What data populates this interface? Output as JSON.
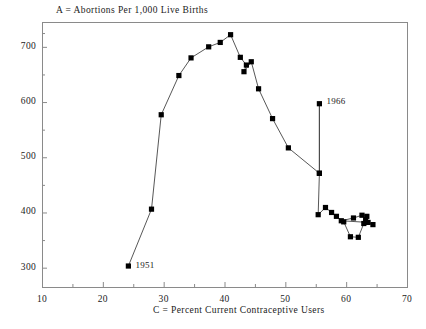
{
  "chart_data": {
    "type": "line",
    "title": "A = Abortions Per 1,000 Live Births",
    "xlabel": "C = Percent Current Contraceptive Users",
    "ylabel": "A = Abortions Per 1,000 Live Births",
    "xlim": [
      10,
      70
    ],
    "ylim": [
      265,
      745
    ],
    "grid": false,
    "legend": false,
    "marker": "filled-square",
    "xticks": [
      10,
      20,
      30,
      40,
      50,
      60,
      70
    ],
    "xtick_labels": [
      "10",
      "20",
      "30",
      "40",
      "50",
      "60",
      "70"
    ],
    "x_minor_ticks": [
      15,
      25,
      35,
      45,
      55,
      65
    ],
    "yticks": [
      300,
      400,
      500,
      600,
      700
    ],
    "ytick_labels": [
      "300",
      "400",
      "500",
      "600",
      "700"
    ],
    "y_minor_ticks": [
      350,
      450,
      550,
      650,
      725
    ],
    "annotations": [
      {
        "text": "1951",
        "x": 24.2,
        "y": 303,
        "dx": 7,
        "dy": 0
      },
      {
        "text": "1966",
        "x": 55.6,
        "y": 597,
        "dx": 7,
        "dy": -2
      }
    ],
    "series": [
      {
        "name": "Abortions vs Contraceptive Use",
        "points": [
          {
            "x": 24.2,
            "y": 303
          },
          {
            "x": 28.0,
            "y": 406
          },
          {
            "x": 29.6,
            "y": 577
          },
          {
            "x": 32.5,
            "y": 648
          },
          {
            "x": 34.5,
            "y": 680
          },
          {
            "x": 37.4,
            "y": 700
          },
          {
            "x": 39.3,
            "y": 708
          },
          {
            "x": 41.0,
            "y": 722
          },
          {
            "x": 42.6,
            "y": 681
          },
          {
            "x": 43.6,
            "y": 667
          },
          {
            "x": 43.2,
            "y": 655
          },
          {
            "x": 44.4,
            "y": 673
          },
          {
            "x": 45.6,
            "y": 624
          },
          {
            "x": 47.9,
            "y": 570
          },
          {
            "x": 50.5,
            "y": 517
          },
          {
            "x": 55.6,
            "y": 471
          },
          {
            "x": 55.6,
            "y": 597
          },
          {
            "x": 55.6,
            "y": 471
          },
          {
            "x": 55.4,
            "y": 396
          },
          {
            "x": 56.6,
            "y": 409
          },
          {
            "x": 57.6,
            "y": 400
          },
          {
            "x": 58.4,
            "y": 393
          },
          {
            "x": 59.6,
            "y": 383
          },
          {
            "x": 60.7,
            "y": 356
          },
          {
            "x": 62.0,
            "y": 355
          },
          {
            "x": 62.9,
            "y": 380
          },
          {
            "x": 63.2,
            "y": 387
          },
          {
            "x": 63.4,
            "y": 393
          },
          {
            "x": 62.6,
            "y": 395
          },
          {
            "x": 61.2,
            "y": 390
          },
          {
            "x": 59.2,
            "y": 385
          },
          {
            "x": 63.6,
            "y": 382
          },
          {
            "x": 64.4,
            "y": 378
          }
        ]
      }
    ],
    "colors": {
      "line": "#444444",
      "marker": "#000000",
      "axis": "#8a8a8a",
      "text": "#1a1a1a",
      "background": "#ffffff"
    }
  }
}
